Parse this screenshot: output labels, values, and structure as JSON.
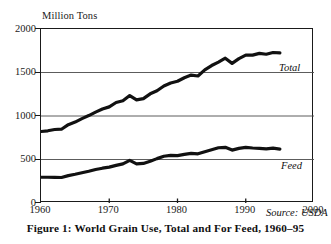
{
  "figure": {
    "caption": "Figure 1: World Grain Use, Total and For Feed, 1960–95",
    "unit_label": "Million Tons",
    "source_note": "Source: USDA"
  },
  "chart_data": {
    "type": "line",
    "title": "Figure 1: World Grain Use, Total and For Feed, 1960–95",
    "xlabel": "",
    "ylabel": "Million Tons",
    "xlim": [
      1960,
      2000
    ],
    "ylim": [
      0,
      2000
    ],
    "xticks": [
      1960,
      1970,
      1980,
      1990,
      2000
    ],
    "yticks": [
      0,
      500,
      1000,
      1500,
      2000
    ],
    "grid": "horizontal",
    "legend": "inline-annotations",
    "annotations": [
      {
        "text": "Total",
        "x": 1996.5,
        "y": 1810
      },
      {
        "text": "Feed",
        "x": 1996.5,
        "y": 690
      },
      {
        "text": "Source: USDA",
        "x": 1994,
        "y": 180
      }
    ],
    "x": [
      1960,
      1961,
      1962,
      1963,
      1964,
      1965,
      1966,
      1967,
      1968,
      1969,
      1970,
      1971,
      1972,
      1973,
      1974,
      1975,
      1976,
      1977,
      1978,
      1979,
      1980,
      1981,
      1982,
      1983,
      1984,
      1985,
      1986,
      1987,
      1988,
      1989,
      1990,
      1991,
      1992,
      1993,
      1994,
      1995
    ],
    "series": [
      {
        "name": "Total",
        "label": "Total",
        "values": [
          822,
          830,
          845,
          848,
          900,
          930,
          970,
          1005,
          1045,
          1080,
          1105,
          1155,
          1175,
          1235,
          1185,
          1200,
          1255,
          1290,
          1345,
          1380,
          1400,
          1440,
          1470,
          1460,
          1530,
          1580,
          1620,
          1665,
          1605,
          1660,
          1700,
          1700,
          1720,
          1710,
          1730,
          1725
        ]
      },
      {
        "name": "Feed",
        "label": "Feed",
        "values": [
          296,
          296,
          295,
          293,
          315,
          330,
          348,
          365,
          385,
          400,
          412,
          432,
          450,
          490,
          450,
          455,
          480,
          510,
          537,
          548,
          545,
          558,
          570,
          565,
          590,
          612,
          635,
          640,
          608,
          628,
          640,
          632,
          628,
          622,
          630,
          620
        ]
      }
    ]
  },
  "axes": {
    "y_ticks": [
      {
        "value": 2000,
        "label": "2000"
      },
      {
        "value": 1500,
        "label": "1500"
      },
      {
        "value": 1000,
        "label": "1000"
      },
      {
        "value": 500,
        "label": "500"
      },
      {
        "value": 0,
        "label": "0"
      }
    ],
    "x_ticks": [
      {
        "value": 1960,
        "label": "1960"
      },
      {
        "value": 1970,
        "label": "1970"
      },
      {
        "value": 1980,
        "label": "1980"
      },
      {
        "value": 1990,
        "label": "1990"
      },
      {
        "value": 2000,
        "label": "2000"
      }
    ]
  }
}
